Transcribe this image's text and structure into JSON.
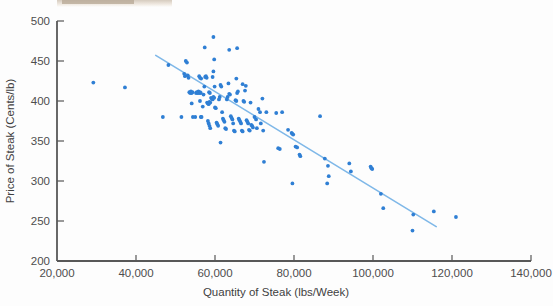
{
  "chart_data": {
    "type": "scatter",
    "title": "",
    "xlabel": "Quantity of Steak (lbs/Week)",
    "ylabel": "Price of Steak (Cents/lb)",
    "xlim": [
      20000,
      140000
    ],
    "ylim": [
      200,
      500
    ],
    "xticks": [
      20000,
      40000,
      60000,
      80000,
      100000,
      120000,
      140000
    ],
    "xticklabels": [
      "20,000",
      "40,000",
      "60,000",
      "80,000",
      "100,000",
      "120,000",
      "140,000"
    ],
    "yticks": [
      200,
      250,
      300,
      350,
      400,
      450,
      500
    ],
    "yticklabels": [
      "200",
      "250",
      "300",
      "350",
      "400",
      "450",
      "500"
    ],
    "grid": false,
    "legend": null,
    "marker_color": "#2f7fd4",
    "trendline": {
      "name": "fitted regression line",
      "color": "#7fb8e8",
      "x_start": 45000,
      "y_start": 457,
      "x_end": 116000,
      "y_end": 243
    },
    "series": [
      {
        "name": "Steak price vs quantity",
        "color": "#2f7fd4",
        "points": [
          [
            29200,
            423
          ],
          [
            37200,
            417
          ],
          [
            46800,
            380
          ],
          [
            48200,
            445
          ],
          [
            51500,
            380
          ],
          [
            52200,
            434
          ],
          [
            52400,
            431
          ],
          [
            52600,
            450
          ],
          [
            52900,
            448
          ],
          [
            53100,
            432
          ],
          [
            53300,
            429
          ],
          [
            53500,
            411
          ],
          [
            53700,
            410
          ],
          [
            53900,
            412
          ],
          [
            54100,
            410
          ],
          [
            54300,
            411
          ],
          [
            54100,
            397
          ],
          [
            54400,
            380
          ],
          [
            55000,
            380
          ],
          [
            55200,
            410
          ],
          [
            55400,
            411
          ],
          [
            55600,
            410
          ],
          [
            55800,
            412
          ],
          [
            56000,
            410
          ],
          [
            56200,
            411
          ],
          [
            56400,
            410
          ],
          [
            56000,
            431
          ],
          [
            56200,
            429
          ],
          [
            56500,
            428
          ],
          [
            56200,
            400
          ],
          [
            56400,
            380
          ],
          [
            56600,
            380
          ],
          [
            56900,
            393
          ],
          [
            57100,
            408
          ],
          [
            57300,
            418
          ],
          [
            57500,
            430
          ],
          [
            57700,
            431
          ],
          [
            57900,
            429
          ],
          [
            57400,
            467
          ],
          [
            58000,
            398
          ],
          [
            58200,
            397
          ],
          [
            58400,
            396
          ],
          [
            58600,
            399
          ],
          [
            58800,
            398
          ],
          [
            58500,
            411
          ],
          [
            58700,
            410
          ],
          [
            58200,
            375
          ],
          [
            58400,
            372
          ],
          [
            58600,
            369
          ],
          [
            58800,
            366
          ],
          [
            59000,
            404
          ],
          [
            59200,
            403
          ],
          [
            59400,
            402
          ],
          [
            59600,
            405
          ],
          [
            59800,
            404
          ],
          [
            59400,
            430
          ],
          [
            59600,
            437
          ],
          [
            59800,
            452
          ],
          [
            59600,
            480
          ],
          [
            59900,
            418
          ],
          [
            60000,
            392
          ],
          [
            60200,
            391
          ],
          [
            60400,
            373
          ],
          [
            60600,
            371
          ],
          [
            60800,
            369
          ],
          [
            61000,
            402
          ],
          [
            61200,
            405
          ],
          [
            61400,
            420
          ],
          [
            61600,
            418
          ],
          [
            61400,
            348
          ],
          [
            61800,
            386
          ],
          [
            62000,
            378
          ],
          [
            62200,
            376
          ],
          [
            62400,
            374
          ],
          [
            62600,
            366
          ],
          [
            62800,
            365
          ],
          [
            63000,
            402
          ],
          [
            63200,
            405
          ],
          [
            63400,
            422
          ],
          [
            63600,
            409
          ],
          [
            63800,
            408
          ],
          [
            63600,
            464
          ],
          [
            64000,
            381
          ],
          [
            64200,
            379
          ],
          [
            64400,
            377
          ],
          [
            64600,
            372
          ],
          [
            64800,
            363
          ],
          [
            65000,
            362
          ],
          [
            65200,
            401
          ],
          [
            65400,
            400
          ],
          [
            65600,
            410
          ],
          [
            65800,
            412
          ],
          [
            65400,
            428
          ],
          [
            65600,
            466
          ],
          [
            66000,
            378
          ],
          [
            66200,
            376
          ],
          [
            66400,
            374
          ],
          [
            66600,
            372
          ],
          [
            66800,
            363
          ],
          [
            67000,
            362
          ],
          [
            67200,
            400
          ],
          [
            67400,
            399
          ],
          [
            67600,
            413
          ],
          [
            67800,
            419
          ],
          [
            67000,
            421
          ],
          [
            68000,
            376
          ],
          [
            68200,
            374
          ],
          [
            68400,
            372
          ],
          [
            68600,
            364
          ],
          [
            68800,
            363
          ],
          [
            69000,
            398
          ],
          [
            69200,
            370
          ],
          [
            69400,
            369
          ],
          [
            69600,
            367
          ],
          [
            70000,
            380
          ],
          [
            70400,
            377
          ],
          [
            70600,
            366
          ],
          [
            71000,
            390
          ],
          [
            71400,
            386
          ],
          [
            71600,
            372
          ],
          [
            72000,
            403
          ],
          [
            72200,
            363
          ],
          [
            72400,
            324
          ],
          [
            73000,
            386
          ],
          [
            75500,
            385
          ],
          [
            76000,
            341
          ],
          [
            76400,
            340
          ],
          [
            77000,
            386
          ],
          [
            78500,
            364
          ],
          [
            79400,
            360
          ],
          [
            79600,
            359
          ],
          [
            79800,
            358
          ],
          [
            79600,
            297
          ],
          [
            80400,
            343
          ],
          [
            80800,
            342
          ],
          [
            81400,
            333
          ],
          [
            81600,
            331
          ],
          [
            86600,
            381
          ],
          [
            87800,
            328
          ],
          [
            88600,
            319
          ],
          [
            88800,
            306
          ],
          [
            88400,
            297
          ],
          [
            94000,
            322
          ],
          [
            94400,
            312
          ],
          [
            99400,
            318
          ],
          [
            99600,
            316
          ],
          [
            99800,
            315
          ],
          [
            102000,
            284
          ],
          [
            102600,
            266
          ],
          [
            110200,
            258
          ],
          [
            110000,
            238
          ],
          [
            115400,
            262
          ],
          [
            121000,
            255
          ]
        ]
      }
    ]
  }
}
